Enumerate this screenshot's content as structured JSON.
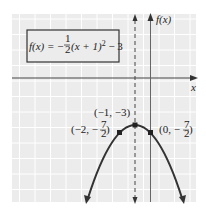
{
  "equation": {
    "lhs": "f(x) = ",
    "sign": "−",
    "frac_num": "1",
    "frac_den": "2",
    "rest_a": "(x + 1)",
    "exp": "2",
    "rest_b": " − 3"
  },
  "axes": {
    "x_label": "x",
    "y_label": "f(x)"
  },
  "points": [
    {
      "name": "vertex",
      "label": "(−1, −3)",
      "x": -1,
      "y": -3
    },
    {
      "name": "left-point",
      "label_a": "(−2, −",
      "num": "7",
      "den": "2",
      "label_b": ")",
      "x": -2,
      "y": -3.5
    },
    {
      "name": "right-point",
      "label_a": "(0, −",
      "num": "7",
      "den": "2",
      "label_b": ")",
      "x": 0,
      "y": -3.5
    }
  ],
  "axis_of_symmetry": {
    "x": -1
  },
  "colors": {
    "grid_bg": "#ececec",
    "grid_line": "#ffffff",
    "curve": "#333333",
    "axis": "#444444"
  }
}
